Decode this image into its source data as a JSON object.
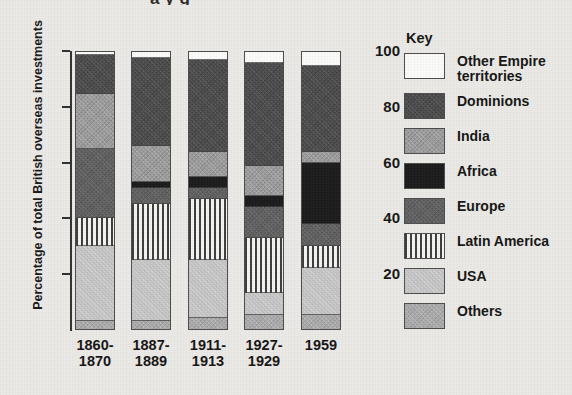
{
  "title_cropped": "a  y  g",
  "axis": {
    "y_title": "Percentage of total British overseas investments",
    "y_ticks": [
      "100",
      "80",
      "60",
      "40",
      "20"
    ],
    "y_min": 0,
    "y_max": 100
  },
  "key": {
    "title": "Key",
    "items": [
      {
        "label": "Other Empire territories",
        "swatch": "sw-empire",
        "name": "other-empire-territories",
        "color": "#fbfbf9"
      },
      {
        "label": "Dominions",
        "swatch": "sw-dominions",
        "name": "dominions",
        "color": "#4a4a4a"
      },
      {
        "label": "India",
        "swatch": "sw-india",
        "name": "india",
        "color": "#9b9b9b"
      },
      {
        "label": "Africa",
        "swatch": "sw-africa",
        "name": "africa",
        "color": "#1a1a1a"
      },
      {
        "label": "Europe",
        "swatch": "sw-europe",
        "name": "europe",
        "color": "#5f5f5f"
      },
      {
        "label": "Latin America",
        "swatch": "sw-latin",
        "name": "latin-america",
        "color": "#3c3c3c"
      },
      {
        "label": "USA",
        "swatch": "sw-usa",
        "name": "usa",
        "color": "#c2c2c2"
      },
      {
        "label": "Others",
        "swatch": "sw-others",
        "name": "others",
        "color": "#a9a9a9"
      }
    ]
  },
  "chart_data": {
    "type": "bar",
    "subtype": "stacked-100",
    "title": "",
    "xlabel": "",
    "ylabel": "Percentage of total British overseas investments",
    "ylim": [
      0,
      100
    ],
    "yticks": [
      20,
      40,
      60,
      80,
      100
    ],
    "grid": false,
    "legend": "right",
    "categories": [
      "1860-1870",
      "1887-1889",
      "1911-1913",
      "1927-1929",
      "1959"
    ],
    "category_lines": [
      [
        "1860-",
        "1870"
      ],
      [
        "1887-",
        "1889"
      ],
      [
        "1911-",
        "1913"
      ],
      [
        "1927-",
        "1929"
      ],
      [
        "1959",
        ""
      ]
    ],
    "stack_order_top_to_bottom": [
      "Other Empire territories",
      "Dominions",
      "India",
      "Africa",
      "Europe",
      "Latin America",
      "USA",
      "Others"
    ],
    "series": [
      {
        "name": "Other Empire territories",
        "values": [
          1,
          2,
          3,
          4,
          5
        ]
      },
      {
        "name": "Dominions",
        "values": [
          14,
          32,
          33,
          37,
          31
        ]
      },
      {
        "name": "India",
        "values": [
          20,
          13,
          9,
          11,
          4
        ]
      },
      {
        "name": "Africa",
        "values": [
          0,
          2,
          4,
          4,
          22
        ]
      },
      {
        "name": "Europe",
        "values": [
          25,
          6,
          4,
          11,
          8
        ]
      },
      {
        "name": "Latin America",
        "values": [
          10,
          20,
          22,
          20,
          8
        ]
      },
      {
        "name": "USA",
        "values": [
          27,
          22,
          21,
          8,
          17
        ]
      },
      {
        "name": "Others",
        "values": [
          3,
          3,
          4,
          5,
          5
        ]
      }
    ]
  }
}
